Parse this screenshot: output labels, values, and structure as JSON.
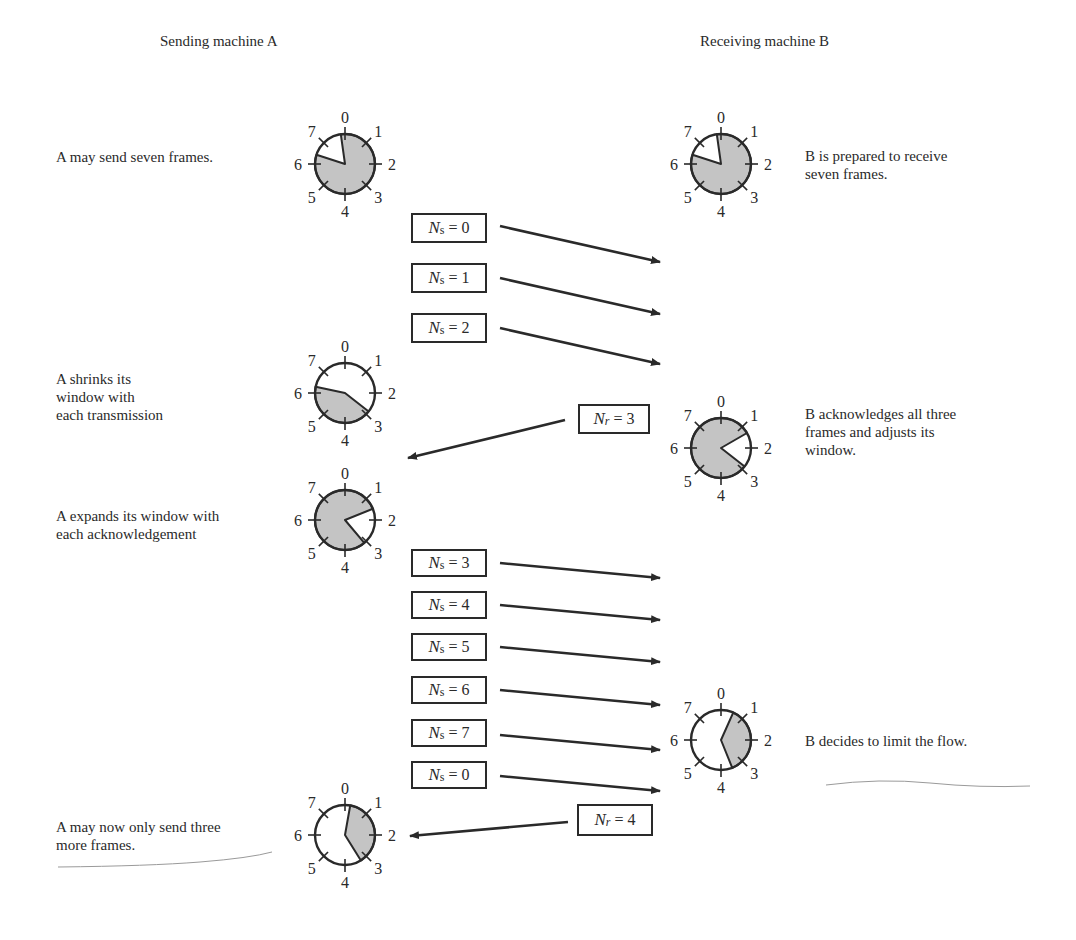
{
  "headings": {
    "sender": "Sending machine A",
    "receiver": "Receiving machine B"
  },
  "notes": {
    "a_initial": [
      "A may send seven frames."
    ],
    "b_initial": [
      "B is prepared to  receive",
      "seven frames."
    ],
    "a_shrink": [
      "A shrinks its",
      "window with",
      "each transmission"
    ],
    "b_ack": [
      "B acknowledges all three",
      "frames and adjusts its",
      "window."
    ],
    "a_expand": [
      "A expands its window with",
      "each acknowledgement"
    ],
    "b_limit": [
      "B decides to limit the flow."
    ],
    "a_final": [
      "A may now only send three",
      "more frames."
    ]
  },
  "colors": {
    "ink": "#2a2a2a",
    "window_fill": "#c4c4c4",
    "background": "#ffffff"
  },
  "clock_labels": [
    "0",
    "1",
    "2",
    "3",
    "4",
    "5",
    "6",
    "7"
  ],
  "clocks": [
    {
      "id": "a-initial",
      "cx": 345,
      "cy": 164,
      "r": 30,
      "shade_start": -8,
      "shade_end": 288
    },
    {
      "id": "b-initial",
      "cx": 721,
      "cy": 164,
      "r": 30,
      "shade_start": -8,
      "shade_end": 288
    },
    {
      "id": "a-shrink",
      "cx": 345,
      "cy": 393,
      "r": 30,
      "shade_start": 128,
      "shade_end": 282
    },
    {
      "id": "b-ack",
      "cx": 721,
      "cy": 448,
      "r": 30,
      "shade_start": 128,
      "shade_end": 420
    },
    {
      "id": "a-expand",
      "cx": 345,
      "cy": 520,
      "r": 30,
      "shade_start": 140,
      "shade_end": 428
    },
    {
      "id": "b-limit",
      "cx": 721,
      "cy": 740,
      "r": 30,
      "shade_start": 24,
      "shade_end": 158
    },
    {
      "id": "a-final",
      "cx": 345,
      "cy": 835,
      "r": 30,
      "shade_start": 10,
      "shade_end": 148
    }
  ],
  "frames": [
    {
      "symbol": "N",
      "sub": "s",
      "value": "0",
      "box": [
        411,
        213,
        76,
        30
      ],
      "arrow": [
        500,
        226,
        660,
        262
      ]
    },
    {
      "symbol": "N",
      "sub": "s",
      "value": "1",
      "box": [
        411,
        263,
        76,
        30
      ],
      "arrow": [
        500,
        278,
        660,
        314
      ]
    },
    {
      "symbol": "N",
      "sub": "s",
      "value": "2",
      "box": [
        411,
        313,
        76,
        30
      ],
      "arrow": [
        500,
        328,
        660,
        364
      ]
    },
    {
      "symbol": "N",
      "sub": "s",
      "value": "3",
      "box": [
        411,
        549,
        76,
        28
      ],
      "arrow": [
        500,
        563,
        660,
        578
      ]
    },
    {
      "symbol": "N",
      "sub": "s",
      "value": "4",
      "box": [
        411,
        591,
        76,
        28
      ],
      "arrow": [
        500,
        605,
        660,
        620
      ]
    },
    {
      "symbol": "N",
      "sub": "s",
      "value": "5",
      "box": [
        411,
        633,
        76,
        28
      ],
      "arrow": [
        500,
        647,
        660,
        662
      ]
    },
    {
      "symbol": "N",
      "sub": "s",
      "value": "6",
      "box": [
        411,
        676,
        76,
        28
      ],
      "arrow": [
        500,
        690,
        660,
        705
      ]
    },
    {
      "symbol": "N",
      "sub": "s",
      "value": "7",
      "box": [
        411,
        719,
        76,
        28
      ],
      "arrow": [
        500,
        735,
        660,
        750
      ]
    },
    {
      "symbol": "N",
      "sub": "s",
      "value": "0",
      "box": [
        411,
        761,
        76,
        28
      ],
      "arrow": [
        500,
        776,
        660,
        791
      ]
    }
  ],
  "acks": [
    {
      "symbol": "N",
      "sub": "r",
      "value": "3",
      "box": [
        578,
        404,
        72,
        30
      ],
      "arrow": [
        565,
        420,
        408,
        458
      ]
    },
    {
      "symbol": "N",
      "sub": "r",
      "value": "4",
      "box": [
        577,
        804,
        76,
        32
      ],
      "arrow": [
        568,
        822,
        410,
        836
      ]
    }
  ]
}
